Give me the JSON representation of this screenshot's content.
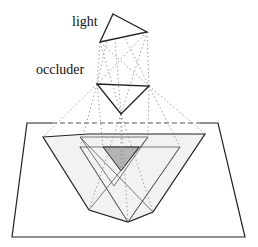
{
  "labels": {
    "light": "light",
    "occluder": "occluder"
  },
  "colors": {
    "stroke": "#222222",
    "dotted": "#888888",
    "penumbra_fill": "#f2f2f2",
    "umbra_fill": "#b4b4b4",
    "background": "#ffffff"
  }
}
